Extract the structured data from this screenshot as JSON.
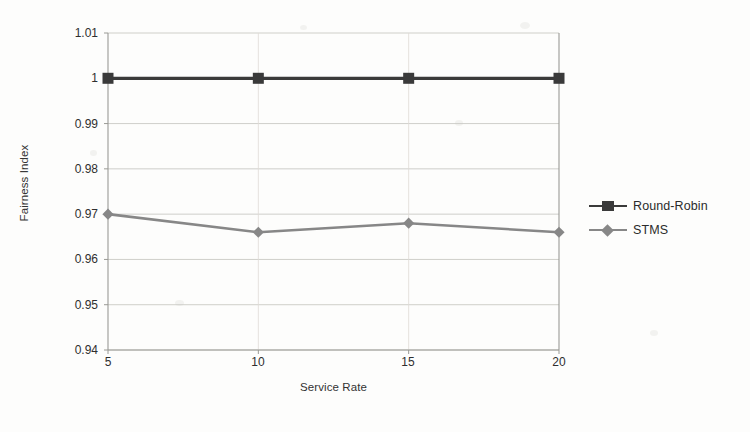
{
  "chart_data": {
    "type": "line",
    "title": "",
    "xlabel": "Service Rate",
    "ylabel": "Fairness Index",
    "x": [
      5,
      10,
      15,
      20
    ],
    "xtick_labels": [
      "5",
      "10",
      "15",
      "20"
    ],
    "ytick_labels": [
      "0.94",
      "0.95",
      "0.96",
      "0.97",
      "0.98",
      "0.99",
      "1",
      "1.01"
    ],
    "ytick_values": [
      0.94,
      0.95,
      0.96,
      0.97,
      0.98,
      0.99,
      1.0,
      1.01
    ],
    "xlim": [
      5,
      20
    ],
    "ylim": [
      0.94,
      1.01
    ],
    "grid": "horizontal",
    "legend_position": "right",
    "series": [
      {
        "name": "Round-Robin",
        "values": [
          1.0,
          1.0,
          1.0,
          1.0
        ],
        "color": "#3a3a3a",
        "marker": "square"
      },
      {
        "name": "STMS",
        "values": [
          0.97,
          0.966,
          0.968,
          0.966
        ],
        "color": "#878787",
        "marker": "diamond"
      }
    ]
  },
  "legend": {
    "items": [
      {
        "label": "Round-Robin",
        "color": "#3a3a3a",
        "marker": "square"
      },
      {
        "label": "STMS",
        "color": "#878787",
        "marker": "diamond"
      }
    ]
  },
  "axes": {
    "x_title": "Service Rate",
    "y_title": "Fairness Index"
  },
  "colors": {
    "background": "#fdfdfc",
    "grid": "#c9c9c4",
    "axis": "#9a9a95",
    "text": "#2b2b2b",
    "round_robin": "#3a3a3a",
    "stms": "#878787"
  }
}
